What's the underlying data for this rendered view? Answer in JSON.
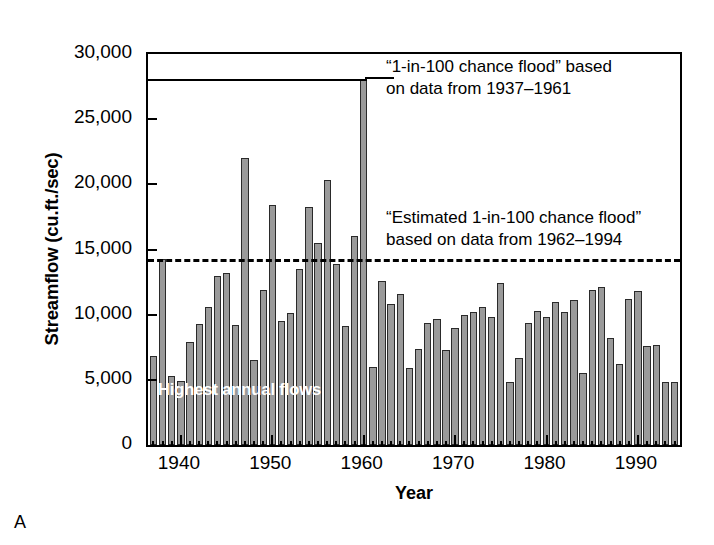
{
  "panel_letter": "A",
  "chart_data": {
    "type": "bar",
    "title": "",
    "xlabel": "Year",
    "ylabel": "Streamflow (cu.ft./sec)",
    "xlim": [
      1936.4,
      1994.6
    ],
    "ylim": [
      0,
      30000
    ],
    "ytick_values": [
      0,
      5000,
      10000,
      15000,
      20000,
      25000,
      30000
    ],
    "ytick_labels": [
      "0",
      "5,000",
      "10,000",
      "15,000",
      "20,000",
      "25,000",
      "30,000"
    ],
    "xtick_values": [
      1940,
      1950,
      1960,
      1970,
      1980,
      1990
    ],
    "xtick_labels": [
      "1940",
      "1950",
      "1960",
      "1970",
      "1980",
      "1990"
    ],
    "grid": false,
    "legend_position": "none",
    "bar_color": "#9a9a9a",
    "bar_edge_color": "#2a2a2a",
    "in_plot_label": "Highest annual flows",
    "categories": [
      1937,
      1938,
      1939,
      1940,
      1941,
      1942,
      1943,
      1944,
      1945,
      1946,
      1947,
      1948,
      1949,
      1950,
      1951,
      1952,
      1953,
      1954,
      1955,
      1956,
      1957,
      1958,
      1959,
      1960,
      1961,
      1962,
      1963,
      1964,
      1965,
      1966,
      1967,
      1968,
      1969,
      1970,
      1971,
      1972,
      1973,
      1974,
      1975,
      1976,
      1977,
      1978,
      1979,
      1980,
      1981,
      1982,
      1983,
      1984,
      1985,
      1986,
      1987,
      1988,
      1989,
      1990,
      1991,
      1992,
      1993,
      1994
    ],
    "values": [
      6800,
      14300,
      5300,
      4900,
      7900,
      9300,
      10600,
      13000,
      13200,
      9200,
      22000,
      6500,
      11900,
      18400,
      9500,
      10100,
      13500,
      18300,
      15500,
      20300,
      13900,
      9100,
      16000,
      28100,
      6000,
      12600,
      10800,
      11600,
      5900,
      7400,
      9400,
      9700,
      7300,
      9000,
      10000,
      10200,
      10600,
      9800,
      12400,
      4800,
      6700,
      9400,
      10300,
      9800,
      11000,
      10200,
      11100,
      5500,
      11900,
      12100,
      8200,
      6200,
      11200,
      11800,
      7600,
      7700,
      4800,
      4800
    ],
    "series_name": "Highest annual flows",
    "thresholds": [
      {
        "id": "line-1937-1961",
        "value": 28100,
        "style": "solid",
        "label_lines": [
          "“1-in-100 chance flood” based",
          "on data from 1937–1961"
        ],
        "x_extent_end_year": 1960
      },
      {
        "id": "line-1962-1994",
        "value": 14300,
        "style": "dashed",
        "label_lines": [
          "“Estimated 1-in-100 chance flood”",
          "based on data from 1962–1994"
        ],
        "x_extent_end_year": 1994
      }
    ]
  }
}
